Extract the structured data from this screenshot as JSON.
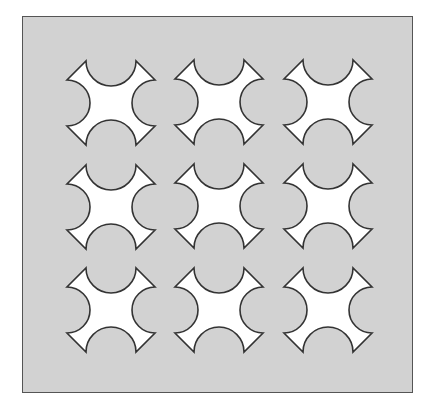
{
  "figure": {
    "panel": {
      "fill": "#d2d2d2",
      "stroke": "#555555"
    },
    "tile": {
      "fill": "#ffffff",
      "stroke": "#333333",
      "width": 88,
      "height": 84,
      "arm": 19,
      "bite_radius": 23
    },
    "grid": {
      "rows": 3,
      "cols": 3
    },
    "tiles": [
      {
        "row": 1,
        "col": 1,
        "x": 67,
        "y": 61
      },
      {
        "row": 1,
        "col": 2,
        "x": 175,
        "y": 60
      },
      {
        "row": 1,
        "col": 3,
        "x": 284,
        "y": 60
      },
      {
        "row": 2,
        "col": 1,
        "x": 67,
        "y": 165
      },
      {
        "row": 2,
        "col": 2,
        "x": 175,
        "y": 164
      },
      {
        "row": 2,
        "col": 3,
        "x": 284,
        "y": 164
      },
      {
        "row": 3,
        "col": 1,
        "x": 67,
        "y": 268
      },
      {
        "row": 3,
        "col": 2,
        "x": 175,
        "y": 268
      },
      {
        "row": 3,
        "col": 3,
        "x": 284,
        "y": 268
      }
    ]
  }
}
